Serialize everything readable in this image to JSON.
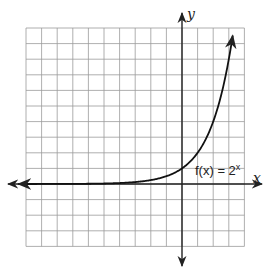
{
  "chart_data": {
    "type": "line",
    "title": "",
    "function_label": "f(x) = 2^x",
    "function_label_parts": {
      "lhs": "f(x) = 2",
      "exp": "x"
    },
    "xlabel": "x",
    "ylabel": "y",
    "grid": true,
    "xlim": [
      -10,
      4
    ],
    "ylim": [
      -4,
      10
    ],
    "series": [
      {
        "name": "f(x) = 2^x",
        "x": [
          -10,
          -6,
          -4,
          -3,
          -2,
          -1,
          0,
          1,
          2,
          3,
          3.3
        ],
        "y": [
          0.001,
          0.016,
          0.0625,
          0.125,
          0.25,
          0.5,
          1,
          2,
          4,
          8,
          9.85
        ]
      }
    ],
    "arrows": [
      "x-axis both ends",
      "y-axis both ends",
      "curve both ends"
    ]
  },
  "colors": {
    "grid": "#9a9a9a",
    "axis": "#222222",
    "curve": "#111111"
  }
}
